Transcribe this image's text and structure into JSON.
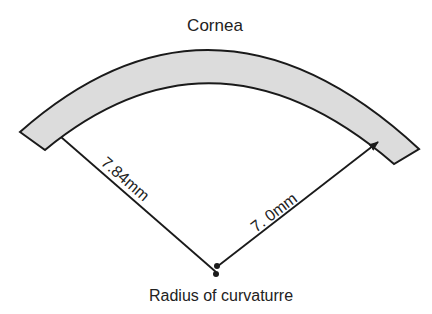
{
  "title": "Cornea",
  "labels": {
    "cornea": "Cornea",
    "left_radius": "7.84mm",
    "right_radius": "7. 0mm",
    "center": "Radius of curvaturre"
  },
  "colors": {
    "cornea_fill": "#dcdcdc",
    "stroke": "#1a1a1a",
    "text": "#222222",
    "background": "#ffffff"
  }
}
